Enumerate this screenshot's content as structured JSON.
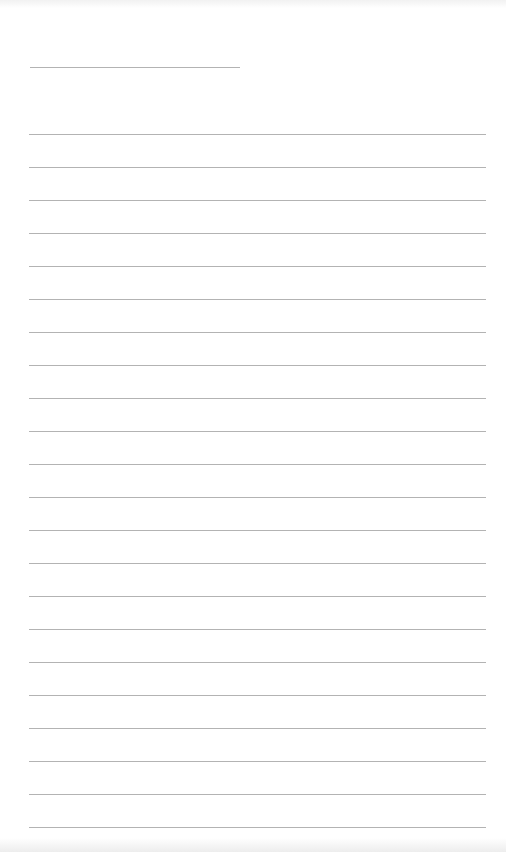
{
  "document": {
    "type": "blank lined sheet",
    "background_color": "#ffffff",
    "line_color": "#9a9a9a",
    "header_line": {
      "x": 30,
      "y": 67,
      "width": 210
    },
    "ruled_lines": {
      "x": 29,
      "width": 457,
      "start_y": 134,
      "spacing": 33,
      "count": 22
    },
    "text_content": []
  }
}
